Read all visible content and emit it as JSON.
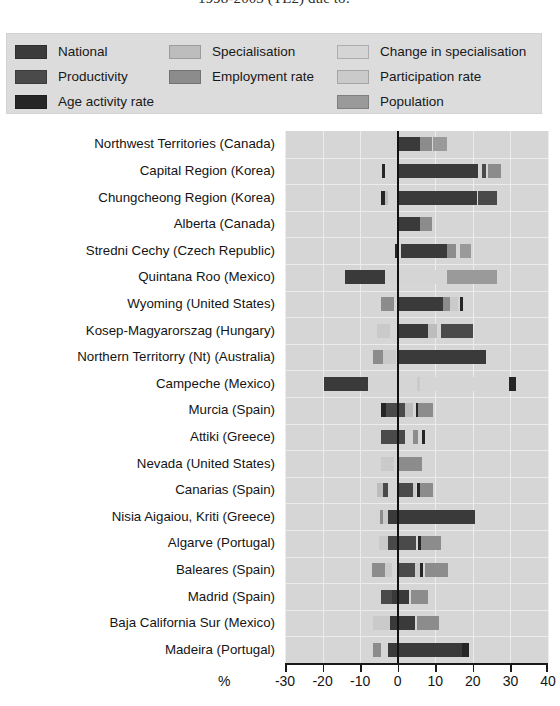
{
  "title": "1998-2003 (TL2) due to:",
  "legend": {
    "columns": [
      [
        {
          "label": "National",
          "color": "#3a3a3a"
        },
        {
          "label": "Productivity",
          "color": "#4a4a4a"
        },
        {
          "label": "Age activity rate",
          "color": "#262626"
        }
      ],
      [
        {
          "label": "Specialisation",
          "color": "#bdbdbd"
        },
        {
          "label": "Employment rate",
          "color": "#8c8c8c"
        },
        {
          "label": "",
          "color": ""
        }
      ],
      [
        {
          "label": "Change in specialisation",
          "color": "#d5d5d5"
        },
        {
          "label": "Participation rate",
          "color": "#cacaca"
        },
        {
          "label": "Population",
          "color": "#9a9a9a"
        }
      ]
    ]
  },
  "chart_data": {
    "type": "bar",
    "orientation": "horizontal",
    "stacked": true,
    "title": "1998-2003 (TL2) due to:",
    "xlabel": "%",
    "ylabel": "",
    "xlim": [
      -30,
      40
    ],
    "xticks": [
      -30,
      -20,
      -10,
      0,
      10,
      20,
      30,
      40
    ],
    "xtick_labels": [
      "-30",
      "-20",
      "-10",
      "0",
      "10",
      "20",
      "30",
      "40"
    ],
    "grid": true,
    "legend_position": "top",
    "series": [
      {
        "name": "National",
        "color": "#3a3a3a"
      },
      {
        "name": "Productivity",
        "color": "#4a4a4a"
      },
      {
        "name": "Age activity rate",
        "color": "#262626"
      },
      {
        "name": "Specialisation",
        "color": "#bdbdbd"
      },
      {
        "name": "Employment rate",
        "color": "#8c8c8c"
      },
      {
        "name": "Change in specialisation",
        "color": "#d5d5d5"
      },
      {
        "name": "Participation rate",
        "color": "#cacaca"
      },
      {
        "name": "Population",
        "color": "#9a9a9a"
      }
    ],
    "categories": [
      "Northwest Territories (Canada)",
      "Capital Region (Korea)",
      "Chungcheong Region (Korea)",
      "Alberta (Canada)",
      "Stredni Cechy (Czech Republic)",
      "Quintana Roo (Mexico)",
      "Wyoming (United States)",
      "Kosep-Magyarorszag (Hungary)",
      "Northern Territorry (Nt) (Australia)",
      "Campeche (Mexico)",
      "Murcia (Spain)",
      "Attiki (Greece)",
      "Nevada (United States)",
      "Canarias  (Spain)",
      "Nisia Aigaiou, Kriti (Greece)",
      "Algarve (Portugal)",
      "Baleares (Spain)",
      "Madrid (Spain)",
      "Baja California Sur (Mexico)",
      "Madeira (Portugal)"
    ],
    "bars": [
      {
        "category": "Northwest Territories (Canada)",
        "segments": [
          {
            "series": "Change in specialisation",
            "start": -2.0,
            "end": 0.0,
            "color": "#d5d5d5"
          },
          {
            "series": "National",
            "start": 0.0,
            "end": 6.0,
            "color": "#3a3a3a"
          },
          {
            "series": "Employment rate",
            "start": 6.0,
            "end": 9.0,
            "color": "#8c8c8c"
          },
          {
            "series": "Population",
            "start": 9.5,
            "end": 13.0,
            "color": "#9a9a9a"
          }
        ]
      },
      {
        "category": "Capital Region (Korea)",
        "segments": [
          {
            "series": "Age activity rate",
            "start": -4.2,
            "end": -3.5,
            "color": "#262626"
          },
          {
            "series": "National",
            "start": 0.0,
            "end": 21.5,
            "color": "#3a3a3a"
          },
          {
            "series": "Productivity",
            "start": 22.5,
            "end": 23.5,
            "color": "#4a4a4a"
          },
          {
            "series": "Employment rate",
            "start": 24.0,
            "end": 27.5,
            "color": "#8c8c8c"
          }
        ]
      },
      {
        "category": "Chungcheong Region (Korea)",
        "segments": [
          {
            "series": "Age activity rate",
            "start": -4.5,
            "end": -3.4,
            "color": "#262626"
          },
          {
            "series": "Specialisation",
            "start": -3.4,
            "end": -2.6,
            "color": "#bdbdbd"
          },
          {
            "series": "National",
            "start": 0.0,
            "end": 21.0,
            "color": "#3a3a3a"
          },
          {
            "series": "Productivity",
            "start": 21.5,
            "end": 26.5,
            "color": "#4a4a4a"
          }
        ]
      },
      {
        "category": "Alberta (Canada)",
        "segments": [
          {
            "series": "National",
            "start": 0.0,
            "end": 6.0,
            "color": "#3a3a3a"
          },
          {
            "series": "Employment rate",
            "start": 6.0,
            "end": 9.0,
            "color": "#8c8c8c"
          }
        ]
      },
      {
        "category": "Stredni Cechy (Czech Republic)",
        "segments": [
          {
            "series": "Age activity rate",
            "start": -0.6,
            "end": 0.0,
            "color": "#262626"
          },
          {
            "series": "National",
            "start": 1.0,
            "end": 13.0,
            "color": "#3a3a3a"
          },
          {
            "series": "Employment rate",
            "start": 13.0,
            "end": 15.5,
            "color": "#8c8c8c"
          },
          {
            "series": "Population",
            "start": 16.5,
            "end": 19.5,
            "color": "#9a9a9a"
          }
        ]
      },
      {
        "category": "Quintana Roo (Mexico)",
        "segments": [
          {
            "series": "National",
            "start": -14.0,
            "end": -3.5,
            "color": "#3a3a3a"
          },
          {
            "series": "Change in specialisation",
            "start": -3.5,
            "end": 13.0,
            "color": "#d5d5d5"
          },
          {
            "series": "Population",
            "start": 13.0,
            "end": 26.5,
            "color": "#9a9a9a"
          }
        ]
      },
      {
        "category": "Wyoming (United States)",
        "segments": [
          {
            "series": "Employment rate",
            "start": -4.5,
            "end": -1.0,
            "color": "#8c8c8c"
          },
          {
            "series": "National",
            "start": 0.0,
            "end": 12.0,
            "color": "#3a3a3a"
          },
          {
            "series": "Employment rate",
            "start": 12.0,
            "end": 14.0,
            "color": "#8c8c8c"
          },
          {
            "series": "Participation rate",
            "start": 14.0,
            "end": 16.0,
            "color": "#cacaca"
          },
          {
            "series": "Age activity rate",
            "start": 16.5,
            "end": 17.5,
            "color": "#262626"
          }
        ]
      },
      {
        "category": "Kosep-Magyarorszag (Hungary)",
        "segments": [
          {
            "series": "Participation rate",
            "start": -5.5,
            "end": -2.0,
            "color": "#cacaca"
          },
          {
            "series": "National",
            "start": 0.0,
            "end": 8.0,
            "color": "#3a3a3a"
          },
          {
            "series": "Specialisation",
            "start": 8.0,
            "end": 10.5,
            "color": "#bdbdbd"
          },
          {
            "series": "Productivity",
            "start": 11.5,
            "end": 20.0,
            "color": "#4a4a4a"
          }
        ]
      },
      {
        "category": "Northern Territorry (Nt) (Australia)",
        "segments": [
          {
            "series": "Employment rate",
            "start": -6.5,
            "end": -4.0,
            "color": "#8c8c8c"
          },
          {
            "series": "Participation rate",
            "start": -4.0,
            "end": -0.5,
            "color": "#cacaca"
          },
          {
            "series": "National",
            "start": 0.0,
            "end": 23.5,
            "color": "#3a3a3a"
          }
        ]
      },
      {
        "category": "Campeche (Mexico)",
        "segments": [
          {
            "series": "National",
            "start": -19.5,
            "end": -8.0,
            "color": "#3a3a3a"
          },
          {
            "series": "Change in specialisation",
            "start": -8.0,
            "end": 5.0,
            "color": "#d5d5d5"
          },
          {
            "series": "Participation rate",
            "start": 5.0,
            "end": 6.0,
            "color": "#cacaca"
          },
          {
            "series": "Change in specialisation",
            "start": 6.0,
            "end": 29.5,
            "color": "#d5d5d5"
          },
          {
            "series": "Age activity rate",
            "start": 29.5,
            "end": 31.5,
            "color": "#262626"
          }
        ]
      },
      {
        "category": "Murcia (Spain)",
        "segments": [
          {
            "series": "Age activity rate",
            "start": -4.5,
            "end": -3.0,
            "color": "#262626"
          },
          {
            "series": "Productivity",
            "start": -3.0,
            "end": 2.0,
            "color": "#4a4a4a"
          },
          {
            "series": "Specialisation",
            "start": 2.0,
            "end": 4.0,
            "color": "#bdbdbd"
          },
          {
            "series": "Age activity rate",
            "start": 4.8,
            "end": 5.5,
            "color": "#262626"
          },
          {
            "series": "Employment rate",
            "start": 5.5,
            "end": 9.5,
            "color": "#8c8c8c"
          }
        ]
      },
      {
        "category": "Attiki (Greece)",
        "segments": [
          {
            "series": "Productivity",
            "start": -4.5,
            "end": 2.0,
            "color": "#4a4a4a"
          },
          {
            "series": "Employment rate",
            "start": 4.0,
            "end": 5.5,
            "color": "#8c8c8c"
          },
          {
            "series": "Age activity rate",
            "start": 6.5,
            "end": 7.2,
            "color": "#262626"
          }
        ]
      },
      {
        "category": "Nevada (United States)",
        "segments": [
          {
            "series": "Participation rate",
            "start": -4.5,
            "end": -1.0,
            "color": "#cacaca"
          },
          {
            "series": "Employment rate",
            "start": 0.0,
            "end": 6.5,
            "color": "#8c8c8c"
          }
        ]
      },
      {
        "category": "Canarias  (Spain)",
        "segments": [
          {
            "series": "Specialisation",
            "start": -5.5,
            "end": -4.0,
            "color": "#bdbdbd"
          },
          {
            "series": "Productivity",
            "start": -4.0,
            "end": -2.5,
            "color": "#4a4a4a"
          },
          {
            "series": "Productivity",
            "start": 0.0,
            "end": 4.0,
            "color": "#4a4a4a"
          },
          {
            "series": "Participation rate",
            "start": 4.0,
            "end": 5.0,
            "color": "#cacaca"
          },
          {
            "series": "Age activity rate",
            "start": 5.2,
            "end": 5.8,
            "color": "#262626"
          },
          {
            "series": "Employment rate",
            "start": 5.8,
            "end": 9.5,
            "color": "#8c8c8c"
          }
        ]
      },
      {
        "category": "Nisia Aigaiou, Kriti (Greece)",
        "segments": [
          {
            "series": "Change in specialisation",
            "start": -6.0,
            "end": -4.8,
            "color": "#d5d5d5"
          },
          {
            "series": "Employment rate",
            "start": -4.8,
            "end": -4.0,
            "color": "#8c8c8c"
          },
          {
            "series": "Participation rate",
            "start": -4.0,
            "end": -2.5,
            "color": "#cacaca"
          },
          {
            "series": "National",
            "start": -2.5,
            "end": 20.5,
            "color": "#3a3a3a"
          }
        ]
      },
      {
        "category": "Algarve (Portugal)",
        "segments": [
          {
            "series": "Participation rate",
            "start": -5.0,
            "end": -2.5,
            "color": "#cacaca"
          },
          {
            "series": "Productivity",
            "start": -2.5,
            "end": 5.0,
            "color": "#4a4a4a"
          },
          {
            "series": "Age activity rate",
            "start": 5.5,
            "end": 6.2,
            "color": "#262626"
          },
          {
            "series": "Employment rate",
            "start": 6.2,
            "end": 11.5,
            "color": "#8c8c8c"
          }
        ]
      },
      {
        "category": "Baleares (Spain)",
        "segments": [
          {
            "series": "Employment rate",
            "start": -6.8,
            "end": -3.5,
            "color": "#8c8c8c"
          },
          {
            "series": "Participation rate",
            "start": -3.5,
            "end": -1.5,
            "color": "#cacaca"
          },
          {
            "series": "Productivity",
            "start": 0.0,
            "end": 4.5,
            "color": "#4a4a4a"
          },
          {
            "series": "Participation rate",
            "start": 4.5,
            "end": 6.0,
            "color": "#cacaca"
          },
          {
            "series": "Age activity rate",
            "start": 6.0,
            "end": 6.8,
            "color": "#262626"
          },
          {
            "series": "Employment rate",
            "start": 7.2,
            "end": 13.5,
            "color": "#8c8c8c"
          }
        ]
      },
      {
        "category": "Madrid (Spain)",
        "segments": [
          {
            "series": "Productivity",
            "start": -4.5,
            "end": -1.5,
            "color": "#4a4a4a"
          },
          {
            "series": "National",
            "start": -1.5,
            "end": 3.0,
            "color": "#3a3a3a"
          },
          {
            "series": "Employment rate",
            "start": 3.5,
            "end": 8.0,
            "color": "#8c8c8c"
          }
        ]
      },
      {
        "category": "Baja California Sur (Mexico)",
        "segments": [
          {
            "series": "Participation rate",
            "start": -6.5,
            "end": -2.0,
            "color": "#cacaca"
          },
          {
            "series": "National",
            "start": -2.0,
            "end": 4.5,
            "color": "#3a3a3a"
          },
          {
            "series": "Employment rate",
            "start": 5.0,
            "end": 11.0,
            "color": "#8c8c8c"
          }
        ]
      },
      {
        "category": "Madeira (Portugal)",
        "segments": [
          {
            "series": "Employment rate",
            "start": -6.5,
            "end": -4.5,
            "color": "#8c8c8c"
          },
          {
            "series": "Change in specialisation",
            "start": -4.5,
            "end": -2.5,
            "color": "#d5d5d5"
          },
          {
            "series": "National",
            "start": -2.5,
            "end": 17.0,
            "color": "#3a3a3a"
          },
          {
            "series": "Age activity rate",
            "start": 17.0,
            "end": 19.0,
            "color": "#262626"
          }
        ]
      }
    ]
  },
  "axis": {
    "percent_symbol": "%"
  }
}
